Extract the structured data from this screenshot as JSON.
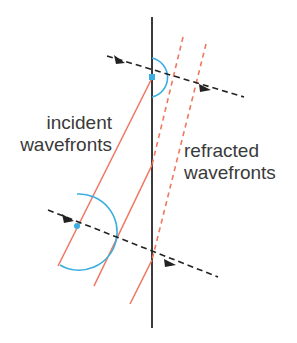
{
  "labels": {
    "incident_line1": "incident",
    "incident_line2": "wavefronts",
    "refracted_line1": "refracted",
    "refracted_line2": "wavefronts"
  },
  "colors": {
    "boundary": "#3a3a3a",
    "incident_wavefront": "#f07860",
    "refracted_wavefront": "#f07860",
    "ray": "#222222",
    "arc": "#3aaee0",
    "dot": "#3aaee0"
  }
}
